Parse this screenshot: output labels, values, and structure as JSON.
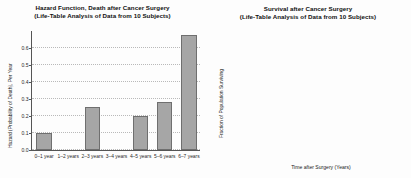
{
  "figure": {
    "background": "#fdfdfd",
    "panels": 2
  },
  "hazard": {
    "title_line1": "Hazard Function, Death after Cancer Surgery",
    "title_line2": "(Life-Table Analysis of Data from 10 Subjects)",
    "ylabel": "Hazard (Probability of Death), Per Year",
    "xlabel": "",
    "yticks": [
      "0.0",
      "0.1",
      "0.2",
      "0.3",
      "0.4",
      "0.5",
      "0.6"
    ],
    "categories": [
      "0–1 year",
      "1–2 years",
      "2–3 years",
      "3–4 years",
      "4–5 years",
      "5–6 years",
      "6–7 years"
    ],
    "bar_color": "#a6a6a6",
    "bar_edge": "#6f6f6f"
  },
  "survival": {
    "title_line1": "Survival after Cancer Surgery",
    "title_line2": "(Life-Table Analysis of Data from 10 Subjects)",
    "ylabel": "Fraction of Population Surviving",
    "xlabel": "Time after Surgery (Years)",
    "yticks": [
      "0.0",
      "0.2",
      "0.4",
      "0.6",
      "0.8",
      "1.0"
    ],
    "xticks": [
      "0",
      "1",
      "2",
      "3",
      "4",
      "5",
      "6"
    ],
    "line_color": "#3c3c3c"
  },
  "chart_data": [
    {
      "type": "bar",
      "title": "Hazard Function, Death after Cancer Surgery (Life-Table Analysis of Data from 10 Subjects)",
      "xlabel": "",
      "ylabel": "Hazard (Probability of Death), Per Year",
      "categories": [
        "0–1 year",
        "1–2 years",
        "2–3 years",
        "3–4 years",
        "4–5 years",
        "5–6 years",
        "6–7 years"
      ],
      "values": [
        0.1,
        0.0,
        0.25,
        0.0,
        0.2,
        0.28,
        0.67
      ],
      "ylim": [
        0.0,
        0.7
      ],
      "yticks": [
        0.0,
        0.1,
        0.2,
        0.3,
        0.4,
        0.5,
        0.6
      ],
      "grid": "horizontal-dotted",
      "legend": "none"
    },
    {
      "type": "line",
      "subtype": "step",
      "title": "Survival after Cancer Surgery (Life-Table Analysis of Data from 10 Subjects)",
      "xlabel": "Time after Surgery (Years)",
      "ylabel": "Fraction of Population Surviving",
      "x": [
        0,
        1,
        2,
        3,
        4,
        5,
        6,
        7
      ],
      "values": [
        1.0,
        0.9,
        0.9,
        0.675,
        0.675,
        0.53,
        0.38,
        0.38
      ],
      "xlim": [
        0,
        7
      ],
      "ylim": [
        0.0,
        1.05
      ],
      "xticks": [
        0,
        1,
        2,
        3,
        4,
        5,
        6
      ],
      "yticks": [
        0.0,
        0.2,
        0.4,
        0.6,
        0.8,
        1.0
      ],
      "grid": "both-dotted",
      "legend": "none"
    }
  ]
}
